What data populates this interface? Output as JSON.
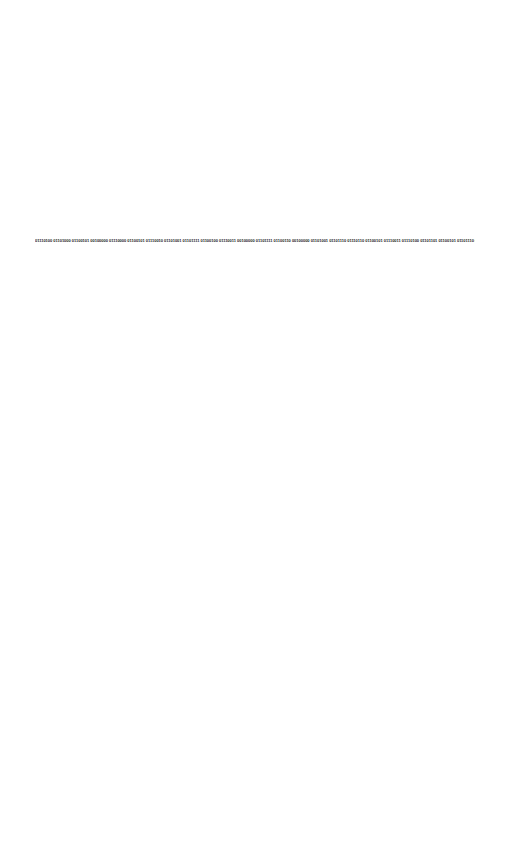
{
  "document": {
    "binary_text": "01110100 01101000 01100101 00100000 01110000 01100101 01110010 01101001 01101111 01100100 01110011 00100000 01101111 01100110 00100000 01101001 01101110 01110110 01100101 01110011 01110100 01101101 01100101 01101110 01110100"
  },
  "colors": {
    "background": "#ffffff",
    "text": "#1a1a1a"
  }
}
